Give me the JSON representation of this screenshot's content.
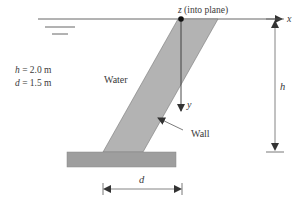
{
  "diagram": {
    "type": "engineering-sketch",
    "labels": {
      "z_axis": "z (into plane)",
      "x_axis": "x",
      "y_axis": "y",
      "water": "Water",
      "wall": "Wall",
      "h_dim": "h",
      "d_dim": "d"
    },
    "parameters": [
      {
        "symbol": "h",
        "eq": " = ",
        "value": "2.0 m"
      },
      {
        "symbol": "d",
        "eq": " = ",
        "value": "1.5 m"
      }
    ],
    "colors": {
      "wall_fill": "#b3b3b3",
      "base_fill": "#9e9e9e",
      "line": "#444444",
      "text": "#3a3a3a",
      "background": "#ffffff"
    }
  }
}
